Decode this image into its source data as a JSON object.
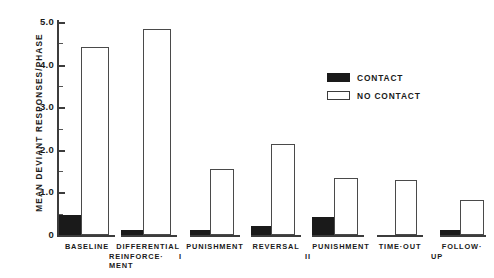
{
  "chart_data": {
    "type": "bar",
    "title": "",
    "xlabel": "",
    "ylabel": "MEAN  DEVIANT  RESPONSES/PHASE",
    "ylim": [
      0,
      5.0
    ],
    "grid": false,
    "legend_position": "upper-right",
    "ytick_labels": [
      "5.0",
      "4.0",
      "3.0",
      "2.0",
      "1.0",
      "0"
    ],
    "ytick_values": [
      5.0,
      4.0,
      3.0,
      2.0,
      1.0,
      0
    ],
    "minor_ticks": [
      4.5,
      3.5,
      2.5,
      1.5,
      0.5
    ],
    "categories": [
      "BASELINE",
      "DIFFERENTIAL REINFORCE-MENT",
      "PUNISHMENT I",
      "REVERSAL",
      "PUNISHMENT II",
      "TIME-OUT",
      "FOLLOW-UP"
    ],
    "category_lines": [
      [
        "BASELINE"
      ],
      [
        "DIFFERENTIAL",
        "REINFORCE·",
        "MENT"
      ],
      [
        "PUNISHMENT",
        "I"
      ],
      [
        "REVERSAL"
      ],
      [
        "PUNISHMENT",
        "II"
      ],
      [
        "TIME·OUT"
      ],
      [
        "FOLLOW·",
        "UP"
      ]
    ],
    "series": [
      {
        "name": "CONTACT",
        "color": "#1a1a1a",
        "values": [
          0.47,
          0.12,
          0.12,
          0.22,
          0.42,
          0.0,
          0.12
        ]
      },
      {
        "name": "NO CONTACT",
        "color": "#ffffff",
        "values": [
          4.41,
          4.84,
          1.55,
          2.14,
          1.34,
          1.29,
          0.82
        ]
      }
    ]
  },
  "legend": {
    "items": [
      {
        "label": "CONTACT",
        "swatch": "filled"
      },
      {
        "label": "NO CONTACT",
        "swatch": "hollow"
      }
    ]
  },
  "axis": {
    "y_title": "MEAN  DEVIANT  RESPONSES/PHASE"
  }
}
